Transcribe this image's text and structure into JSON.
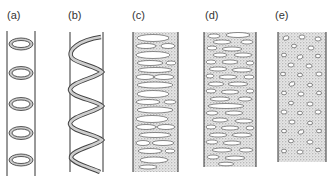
{
  "figure": {
    "panels": [
      {
        "label": "(a)",
        "type": "annular thickening",
        "x": 7
      },
      {
        "label": "(b)",
        "type": "spiral thickening",
        "x": 68
      },
      {
        "label": "(c)",
        "type": "scalariform thickening",
        "x": 132
      },
      {
        "label": "(d)",
        "type": "reticulate thickening",
        "x": 205
      },
      {
        "label": "(e)",
        "type": "pitted thickening",
        "x": 275
      }
    ],
    "colors": {
      "ink": "#333333",
      "stipple": "#bbbbbb",
      "background": "#ffffff"
    }
  }
}
